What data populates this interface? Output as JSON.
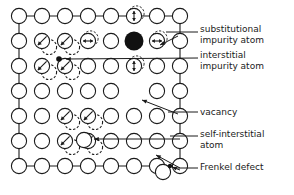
{
  "figure": {
    "kind": "crystal-lattice-point-defects-diagram",
    "background_color": "#ffffff",
    "ink_color": "#1a1a1a",
    "filled_atom_color": "#111111"
  },
  "labels": [
    {
      "id": "substitutional-impurity-atom",
      "text": "substitutional\nimpurity atom",
      "x": 200,
      "y": 24
    },
    {
      "id": "interstitial-impurity-atom",
      "text": "interstitial\nimpurity atom",
      "x": 200,
      "y": 50
    },
    {
      "id": "vacancy",
      "text": "vacancy",
      "x": 200,
      "y": 108
    },
    {
      "id": "self-interstitial-atom",
      "text": "self-interstitial\natom",
      "x": 200,
      "y": 130
    },
    {
      "id": "frenkel-defect",
      "text": "Frenkel defect",
      "x": 200,
      "y": 163
    }
  ],
  "legend_terms": [
    "substitutional impurity atom",
    "interstitial impurity atom",
    "vacancy",
    "self-interstitial atom",
    "Frenkel defect"
  ],
  "lattice": {
    "columns": 8,
    "rows": 7,
    "origin_x": 19,
    "origin_y": 16,
    "spacing_x": 23,
    "spacing_y": 25,
    "atom_radius": 7.6,
    "bond_color": "#1a1a1a"
  },
  "defects": {
    "substitutional_impurity": {
      "col": 5,
      "row": 1,
      "radius": 9.5,
      "filled": true
    },
    "interstitial_impurity_dot": {
      "x": 59,
      "y": 59,
      "radius": 2.8,
      "filled": true
    },
    "vacancy": {
      "col": 5,
      "row": 3
    },
    "self_interstitial": {
      "x": 84,
      "y": 140,
      "radius": 7.6
    },
    "frenkel_vacancy_dot": {
      "x": 170,
      "y": 166,
      "radius": 2.2
    },
    "frenkel_interstitial": {
      "x": 163,
      "y": 172,
      "radius": 7.6
    },
    "interstitial_impurity_small_circles": [
      {
        "col": 3,
        "row": 1,
        "arrow": "horizontal"
      },
      {
        "col": 6,
        "row": 1,
        "arrow": "horizontal"
      },
      {
        "col": 5,
        "row": 0,
        "arrow": "vertical"
      },
      {
        "col": 5,
        "row": 2,
        "arrow": "vertical"
      }
    ],
    "displaced_atom_pairs": [
      {
        "col": 1,
        "row": 1
      },
      {
        "col": 2,
        "row": 1
      },
      {
        "col": 1,
        "row": 2
      },
      {
        "col": 2,
        "row": 2
      },
      {
        "col": 2,
        "row": 4
      },
      {
        "col": 3,
        "row": 4
      },
      {
        "col": 2,
        "row": 5
      },
      {
        "col": 3,
        "row": 5
      }
    ]
  },
  "leader_lines": [
    {
      "id": "leader-substitutional",
      "from_x": 198,
      "from_y": 32,
      "to_x": 166,
      "to_y": 32,
      "arrow": false
    },
    {
      "id": "arrow-substitutional",
      "from_x": 178,
      "from_y": 36,
      "to_x": 160,
      "to_y": 45,
      "arrow": true
    },
    {
      "id": "leader-interstitial-impurity",
      "from_x": 198,
      "from_y": 58,
      "to_x": 66,
      "to_y": 59,
      "arrow": true
    },
    {
      "id": "leader-vacancy",
      "from_x": 198,
      "from_y": 112,
      "to_x": 168,
      "to_y": 112,
      "arrow": false
    },
    {
      "id": "arrow-vacancy",
      "from_x": 178,
      "from_y": 114,
      "to_x": 142,
      "to_y": 100,
      "arrow": true
    },
    {
      "id": "leader-self-interstitial",
      "from_x": 198,
      "from_y": 136,
      "to_x": 170,
      "to_y": 136,
      "arrow": false
    },
    {
      "id": "arrow-self-interstitial",
      "from_x": 180,
      "from_y": 139,
      "to_x": 94,
      "to_y": 139,
      "arrow": true
    },
    {
      "id": "leader-frenkel",
      "from_x": 198,
      "from_y": 168,
      "to_x": 176,
      "to_y": 168,
      "arrow": false
    },
    {
      "id": "arrow-frenkel-a",
      "from_x": 180,
      "from_y": 168,
      "to_x": 156,
      "to_y": 155,
      "arrow": true
    },
    {
      "id": "arrow-frenkel-b",
      "from_x": 180,
      "from_y": 170,
      "to_x": 172,
      "to_y": 167,
      "arrow": true
    }
  ]
}
